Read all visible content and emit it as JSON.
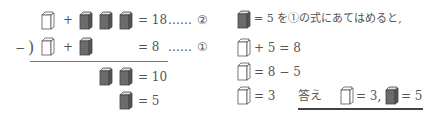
{
  "colors": {
    "white_box": "#ffffff",
    "gray_box": "#6b6b6b",
    "stroke": "#555555",
    "text": "#555555"
  },
  "icons": {
    "white_box": "white-box-icon",
    "gray_box": "gray-box-icon"
  },
  "left": {
    "eq2": {
      "plus": "+",
      "rhs": "= 18",
      "dots": "……",
      "label": "②"
    },
    "eq1": {
      "minus": "−",
      "paren": ")",
      "plus": "+",
      "rhs": "= 8",
      "dots": "……",
      "label": "①"
    },
    "diff": {
      "rhs": "= 10"
    },
    "single": {
      "rhs": "= 5"
    }
  },
  "right": {
    "line1": "= 5 を①の式にあてはめると,",
    "line2": "+ 5 = 8",
    "line3": "= 8 − 5",
    "line4": "= 3",
    "answer_label": "答え",
    "answer_white": "= 3,",
    "answer_gray": "= 5"
  }
}
